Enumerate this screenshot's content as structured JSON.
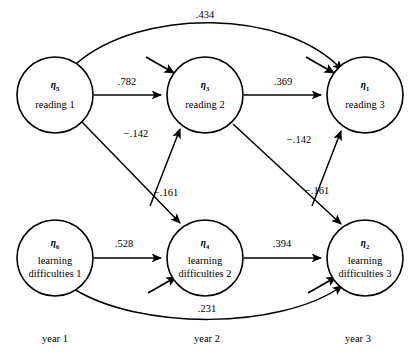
{
  "diagram": {
    "type": "path-diagram",
    "stroke_color": "#000000",
    "background_color": "#ffffff",
    "nodes": [
      {
        "id": "eta5",
        "eta": "η",
        "sub": "5",
        "label_line1": "reading 1",
        "label_line2": "",
        "cx": 55,
        "cy": 95,
        "r": 38
      },
      {
        "id": "eta3",
        "eta": "η",
        "sub": "3",
        "label_line1": "reading 2",
        "label_line2": "",
        "cx": 205,
        "cy": 95,
        "r": 38
      },
      {
        "id": "eta1",
        "eta": "η",
        "sub": "1",
        "label_line1": "reading 3",
        "label_line2": "",
        "cx": 365,
        "cy": 95,
        "r": 38
      },
      {
        "id": "eta6",
        "eta": "η",
        "sub": "6",
        "label_line1": "learning",
        "label_line2": "difficulties 1",
        "cx": 55,
        "cy": 258,
        "r": 38
      },
      {
        "id": "eta4",
        "eta": "η",
        "sub": "4",
        "label_line1": "learning",
        "label_line2": "difficulties 2",
        "cx": 205,
        "cy": 258,
        "r": 38
      },
      {
        "id": "eta2",
        "eta": "η",
        "sub": "2",
        "label_line1": "learning",
        "label_line2": "difficulties 3",
        "cx": 365,
        "cy": 258,
        "r": 38
      }
    ],
    "edges": [
      {
        "id": "e-r1-r3",
        "from": "eta5",
        "to": "eta1",
        "coefficient": ".434",
        "label_x": 205,
        "label_y": 18,
        "shape": "curve-top"
      },
      {
        "id": "e-r1-r2",
        "from": "eta5",
        "to": "eta3",
        "coefficient": ".782",
        "label_x": 127,
        "label_y": 85,
        "shape": "straight"
      },
      {
        "id": "e-r2-r3",
        "from": "eta3",
        "to": "eta1",
        "coefficient": ".369",
        "label_x": 278,
        "label_y": 85,
        "shape": "straight"
      },
      {
        "id": "e-ld1-r2",
        "from": "eta6",
        "to": "eta3",
        "coefficient": "−.142",
        "label_x": 136,
        "label_y": 137,
        "shape": "straight"
      },
      {
        "id": "e-ld2-r3",
        "from": "eta4",
        "to": "eta1",
        "coefficient": "−.142",
        "label_x": 299,
        "label_y": 143,
        "shape": "straight"
      },
      {
        "id": "e-r1-ld2",
        "from": "eta5",
        "to": "eta4",
        "coefficient": "−.161",
        "label_x": 166,
        "label_y": 196,
        "shape": "straight"
      },
      {
        "id": "e-r2-ld3",
        "from": "eta3",
        "to": "eta2",
        "coefficient": "−.161",
        "label_x": 317,
        "label_y": 194,
        "shape": "straight"
      },
      {
        "id": "e-ld1-ld2",
        "from": "eta6",
        "to": "eta4",
        "coefficient": ".528",
        "label_x": 124,
        "label_y": 247,
        "shape": "straight"
      },
      {
        "id": "e-ld2-ld3",
        "from": "eta4",
        "to": "eta2",
        "coefficient": ".394",
        "label_x": 282,
        "label_y": 247,
        "shape": "straight"
      },
      {
        "id": "e-ld1-ld3",
        "from": "eta6",
        "to": "eta2",
        "coefficient": ".231",
        "label_x": 207,
        "label_y": 312,
        "shape": "curve-bottom"
      }
    ],
    "disturbances": [
      {
        "id": "d-eta3",
        "target": "eta3",
        "direction": "down-right"
      },
      {
        "id": "d-eta1",
        "target": "eta1",
        "direction": "down-right"
      },
      {
        "id": "d-eta4",
        "target": "eta4",
        "direction": "up-right"
      },
      {
        "id": "d-eta2",
        "target": "eta2",
        "direction": "up-right"
      }
    ],
    "time_axis": [
      {
        "id": "year-1",
        "label": "year 1",
        "x": 55,
        "y": 342
      },
      {
        "id": "year-2",
        "label": "year 2",
        "x": 207,
        "y": 342
      },
      {
        "id": "year-3",
        "label": "year 3",
        "x": 358,
        "y": 342
      }
    ]
  }
}
